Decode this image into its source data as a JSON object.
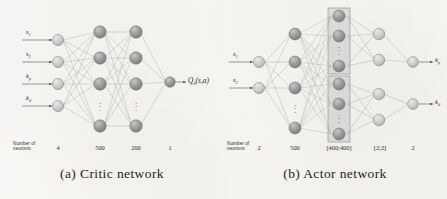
{
  "figure": {
    "background_color": "#f7f6f3",
    "panels": [
      {
        "id": "critic",
        "caption": "(a) Critic network",
        "neuron_label_line1": "Number of",
        "neuron_label_line2": "neurons:",
        "inputs": [
          {
            "base": "s",
            "sub": "1"
          },
          {
            "base": "s",
            "sub": "2"
          },
          {
            "base": "k",
            "sub": "p"
          },
          {
            "base": "k",
            "sub": "d"
          }
        ],
        "output_label": {
          "base": "Q",
          "sub": "θ",
          "args": "(s,a)"
        },
        "layer_counts": [
          "4",
          "500",
          "200",
          "1"
        ],
        "layers": [
          {
            "name": "input",
            "count": "4",
            "drawn_nodes": 4,
            "ellipsis": false
          },
          {
            "name": "hidden-1",
            "count": "500",
            "drawn_nodes": 4,
            "ellipsis": true
          },
          {
            "name": "hidden-2",
            "count": "200",
            "drawn_nodes": 4,
            "ellipsis": true
          },
          {
            "name": "output",
            "count": "1",
            "drawn_nodes": 1,
            "ellipsis": false
          }
        ]
      },
      {
        "id": "actor",
        "caption": "(b) Actor network",
        "neuron_label_line1": "Number of",
        "neuron_label_line2": "neurons:",
        "inputs": [
          {
            "base": "s",
            "sub": "1"
          },
          {
            "base": "s",
            "sub": "2"
          }
        ],
        "outputs": [
          {
            "base": "k",
            "sub": "p"
          },
          {
            "base": "k",
            "sub": "d"
          }
        ],
        "layer_counts": [
          "2",
          "500",
          "[400;400]",
          "[2;2]",
          "2"
        ],
        "layers": [
          {
            "name": "input",
            "count": "2",
            "drawn_nodes": 2,
            "ellipsis": false
          },
          {
            "name": "hidden-1",
            "count": "500",
            "drawn_nodes": 4,
            "ellipsis": true
          },
          {
            "name": "split-hidden",
            "count": "[400;400]",
            "drawn_nodes": 6,
            "ellipsis": true,
            "grouped": true
          },
          {
            "name": "split-head",
            "count": "[2;2]",
            "drawn_nodes": 4,
            "ellipsis": false
          },
          {
            "name": "output",
            "count": "2",
            "drawn_nodes": 2,
            "ellipsis": false
          }
        ]
      }
    ],
    "colors": {
      "node_dark": "#8f8f8f",
      "node_light": "#c9c9c9",
      "node_stroke": "#6e6e6e",
      "edge": "#9a9a9a",
      "group_box_fill": "#cfcfcf",
      "group_box_stroke": "#8a8a8a",
      "text": "#2b2b2b"
    }
  }
}
